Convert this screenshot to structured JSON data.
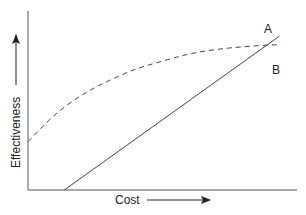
{
  "chart_data": {
    "type": "line",
    "title": "",
    "xlabel": "Cost",
    "ylabel": "Effectiveness",
    "xlim": [
      0,
      1
    ],
    "ylim": [
      0,
      1
    ],
    "grid": false,
    "ticks": "none",
    "series": [
      {
        "name": "A",
        "style": "solid",
        "x": [
          0.135,
          0.935
        ],
        "y": [
          0.0,
          0.86
        ]
      },
      {
        "name": "B",
        "style": "dashed",
        "x": [
          0.0,
          0.1,
          0.2,
          0.3,
          0.4,
          0.5,
          0.6,
          0.7,
          0.8,
          0.9,
          0.94
        ],
        "y": [
          0.27,
          0.42,
          0.53,
          0.61,
          0.675,
          0.72,
          0.76,
          0.785,
          0.8,
          0.81,
          0.81
        ]
      }
    ],
    "annotations": [
      {
        "text": "A",
        "target": "series A end"
      },
      {
        "text": "B",
        "target": "series B end"
      }
    ],
    "axis_arrows": {
      "x": "increasing to right",
      "y": "increasing upward"
    }
  },
  "colors": {
    "ink": "#333333",
    "background": "#ffffff"
  }
}
